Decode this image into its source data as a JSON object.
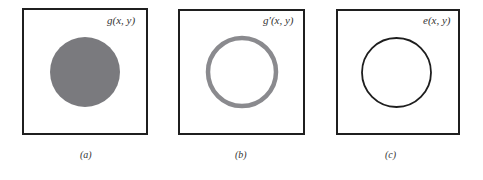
{
  "figure": {
    "panels": [
      {
        "id": "a",
        "function_label": "g(x, y)",
        "caption": "(a)",
        "shape": "filled-disk",
        "fill_color": "#7a7a7e"
      },
      {
        "id": "b",
        "function_label": "g′(x, y)",
        "caption": "(b)",
        "shape": "thick-ring",
        "stroke_color": "#8a8a8e"
      },
      {
        "id": "c",
        "function_label": "e(x, y)",
        "caption": "(c)",
        "shape": "thin-contour",
        "stroke_color": "#1e1e1e"
      }
    ]
  }
}
